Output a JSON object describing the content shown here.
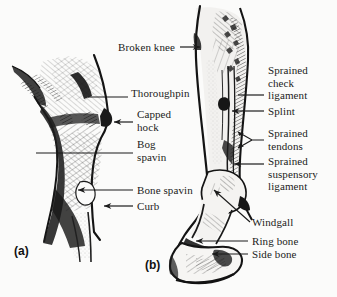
{
  "figure": {
    "background_color": "#fbfbfa",
    "ink_color": "#1b1b1b",
    "panels": [
      {
        "id": "a",
        "label": "(a)",
        "subject": "hock-lateral-view",
        "x": 14,
        "y": 244
      },
      {
        "id": "b",
        "label": "(b)",
        "subject": "foreleg-cannon-fetlock-hoof",
        "x": 145,
        "y": 258
      }
    ]
  },
  "labels": {
    "panel_a": [
      {
        "name": "thoroughpin",
        "text": "Thoroughpin",
        "x": 131,
        "y": 93,
        "leader": "line-left"
      },
      {
        "name": "capped-hock",
        "text": "Capped\nhock",
        "x": 137,
        "y": 114,
        "leader": "arrow-left"
      },
      {
        "name": "bog-spavin",
        "text": "Bog\nspavin",
        "x": 137,
        "y": 144,
        "leader": "line-left"
      },
      {
        "name": "bone-spavin",
        "text": "Bone spavin",
        "x": 137,
        "y": 186,
        "leader": "arrow-left"
      },
      {
        "name": "curb",
        "text": "Curb",
        "x": 137,
        "y": 202,
        "leader": "arrow-left"
      }
    ],
    "panel_b": [
      {
        "name": "broken-knee",
        "text": "Broken knee",
        "x": 118,
        "y": 42,
        "leader": "arrow-right"
      },
      {
        "name": "sprained-check-ligament",
        "text": "Sprained\ncheck\nligament",
        "x": 268,
        "y": 67,
        "leader": "line-left"
      },
      {
        "name": "splint",
        "text": "Splint",
        "x": 268,
        "y": 107,
        "leader": "line-left"
      },
      {
        "name": "sprained-tendons",
        "text": "Sprained\ntendons",
        "x": 268,
        "y": 131,
        "leader": "bracket-left"
      },
      {
        "name": "sprained-suspensory-ligament",
        "text": "Sprained\nsuspensory\nligament",
        "x": 268,
        "y": 158,
        "leader": "arrow-left"
      },
      {
        "name": "windgall",
        "text": "Windgall",
        "x": 252,
        "y": 222,
        "leader": "diagonal-up-left"
      },
      {
        "name": "ring-bone",
        "text": "Ring bone",
        "x": 252,
        "y": 238,
        "leader": "arrow-left"
      },
      {
        "name": "side-bone",
        "text": "Side bone",
        "x": 252,
        "y": 251,
        "leader": "arrow-left"
      }
    ]
  }
}
